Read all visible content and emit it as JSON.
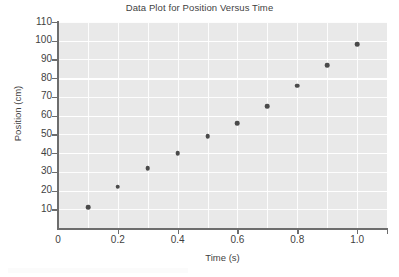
{
  "chart_data": {
    "type": "scatter",
    "title": "Data Plot for Position Versus Time",
    "xlabel": "Time (s)",
    "ylabel": "Position (cm)",
    "x": [
      0.1,
      0.2,
      0.3,
      0.4,
      0.5,
      0.6,
      0.7,
      0.8,
      0.9,
      1.0
    ],
    "y": [
      11,
      22,
      32,
      40,
      49,
      56,
      65,
      76,
      87,
      98
    ],
    "series": [
      {
        "name": "Position",
        "points": [
          {
            "x": 0.1,
            "y": 11
          },
          {
            "x": 0.2,
            "y": 22
          },
          {
            "x": 0.3,
            "y": 32
          },
          {
            "x": 0.4,
            "y": 40
          },
          {
            "x": 0.5,
            "y": 49
          },
          {
            "x": 0.6,
            "y": 56
          },
          {
            "x": 0.7,
            "y": 65
          },
          {
            "x": 0.8,
            "y": 76
          },
          {
            "x": 0.9,
            "y": 87
          },
          {
            "x": 1.0,
            "y": 98
          }
        ]
      }
    ],
    "xlim": [
      0.0,
      1.1
    ],
    "ylim": [
      0,
      110
    ],
    "xticks": [
      0.0,
      0.2,
      0.4,
      0.6,
      0.8,
      1.0
    ],
    "xtick_labels": [
      "0",
      "0.2",
      "0.4",
      "0.6",
      "0.8",
      "1.0"
    ],
    "yticks": [
      10,
      20,
      30,
      40,
      50,
      60,
      70,
      80,
      90,
      100,
      110
    ],
    "ytick_labels": [
      "10",
      "20",
      "30",
      "40",
      "50",
      "60",
      "70",
      "80",
      "90",
      "100",
      "110"
    ],
    "grid": true,
    "grid_x_step": 0.1,
    "grid_y_step": 10,
    "legend": null,
    "marker": "circle",
    "marker_color": "#4a4a4a",
    "plot_background": "#e9e9e9",
    "gridline_color": "#ffffff",
    "axis_color": "#6d6d6d"
  }
}
